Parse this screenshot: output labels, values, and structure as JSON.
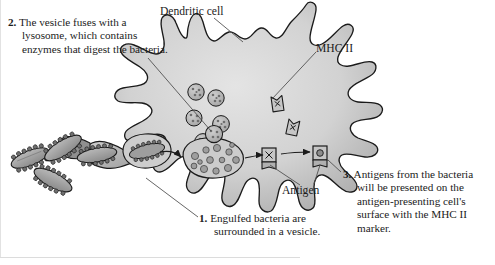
{
  "figure": {
    "background_color": "#ffffff",
    "ink_color": "#1b1b1b",
    "cell_fill_light": "#d9d9d9",
    "cell_fill_mid": "#c0c0c0",
    "cell_fill_dark": "#8d8d8d",
    "organelle_fill": "#b4b4b4",
    "bacteria_fill": "#a8a8a8"
  },
  "labels": {
    "dendritic_cell": "Dendritic cell",
    "mhc_ii": "MHC II",
    "antigen": "Antigen"
  },
  "captions": {
    "step2": {
      "number": "2.",
      "text": "The vesicle fuses with a lysosome, which contains enzymes that digest the bacteria."
    },
    "step1": {
      "number": "1.",
      "text": "Engulfed bacteria are surrounded in a vesicle."
    },
    "step3": {
      "number": "3.",
      "text": "Antigens from the bacteria will be presented on the antigen-presenting cell's surface with the MHC II marker."
    }
  },
  "elements": {
    "bacteria_label": "rod-shaped bacteria with pili",
    "bacteria_count": 4,
    "lysosome_label": "lysosome",
    "lysosome_count": 6,
    "phagosome_label": "vesicle containing engulfed bacterium",
    "phagolysosome_label": "phagolysosome with digested bacterial fragments",
    "mhc_molecule_label": "MHC II flag molecule",
    "mhc_free_count": 2,
    "mhc_surface_complex_count": 2,
    "arrow_label": "process arrow"
  },
  "icons": {
    "bacterium": "bacterium-icon",
    "lysosome": "lysosome-icon",
    "vesicle": "vesicle-icon",
    "mhc_flag": "mhc-flag-icon",
    "arrow": "arrow-icon"
  }
}
